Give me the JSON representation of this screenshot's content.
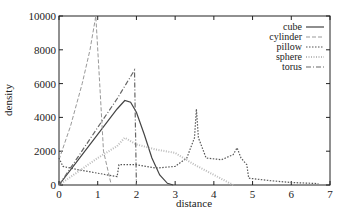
{
  "chart_data": {
    "type": "line",
    "title": "",
    "xlabel": "distance",
    "ylabel": "density",
    "xlim": [
      0,
      7
    ],
    "ylim": [
      0,
      10000
    ],
    "xticks": [
      "0",
      "1",
      "2",
      "3",
      "4",
      "5",
      "6",
      "7"
    ],
    "yticks": [
      "0",
      "2000",
      "4000",
      "6000",
      "8000",
      "10000"
    ],
    "grid": false,
    "legend_position": "top-right",
    "series": [
      {
        "name": "cube",
        "style": "solid",
        "color": "#444444",
        "x": [
          0,
          0.5,
          1.0,
          1.5,
          1.7,
          1.85,
          2.0,
          2.2,
          2.4,
          2.6,
          2.8,
          2.95
        ],
        "y": [
          0,
          1500,
          3000,
          4500,
          5000,
          4900,
          4300,
          3000,
          1600,
          600,
          100,
          0
        ]
      },
      {
        "name": "cylinder",
        "style": "dashed-light",
        "color": "#999999",
        "x": [
          0,
          0.3,
          0.6,
          0.8,
          0.95,
          1.05,
          1.15,
          1.35
        ],
        "y": [
          1500,
          3500,
          6000,
          8000,
          10000,
          6000,
          2000,
          0
        ]
      },
      {
        "name": "pillow",
        "style": "dotted",
        "color": "#555555",
        "x": [
          0,
          0.1,
          0.5,
          1.0,
          1.5,
          1.55,
          2.0,
          2.5,
          3.0,
          3.3,
          3.5,
          3.55,
          3.6,
          3.8,
          4.2,
          4.5,
          4.6,
          4.7,
          4.85,
          4.9,
          5.5,
          6.0,
          6.7
        ],
        "y": [
          1600,
          1100,
          900,
          700,
          500,
          1200,
          1200,
          1000,
          1100,
          1600,
          2800,
          4500,
          2800,
          1600,
          1500,
          1800,
          2200,
          1600,
          1200,
          400,
          250,
          150,
          80
        ]
      },
      {
        "name": "sphere",
        "style": "dotted-light",
        "color": "#bbbbbb",
        "x": [
          0,
          0.5,
          1.0,
          1.5,
          1.7,
          2.0,
          2.5,
          3.0,
          3.5,
          4.0,
          4.5
        ],
        "y": [
          0,
          800,
          1600,
          2300,
          2800,
          2400,
          2100,
          1900,
          1200,
          600,
          0
        ]
      },
      {
        "name": "torus",
        "style": "dash-dot",
        "color": "#666666",
        "x": [
          0,
          0.5,
          1.0,
          1.5,
          1.95,
          2.0
        ],
        "y": [
          0,
          1700,
          3400,
          5100,
          6800,
          0
        ]
      }
    ]
  }
}
